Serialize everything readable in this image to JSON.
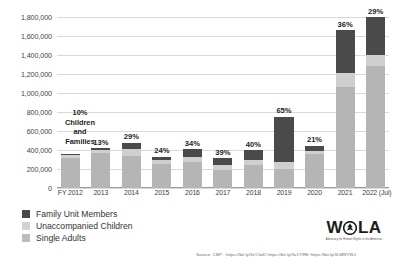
{
  "chart_data": {
    "type": "bar",
    "stacked": true,
    "title": "",
    "xlabel": "",
    "ylabel": "",
    "ylim": [
      0,
      1800000
    ],
    "ytick_step": 200000,
    "grid": true,
    "legend_position": "bottom-left",
    "categories": [
      "FY 2012",
      "2013",
      "2014",
      "2015",
      "2016",
      "2017",
      "2018",
      "2019",
      "2020",
      "2021",
      "2022 (Jul)"
    ],
    "ytick_labels": [
      "0",
      "200,000",
      "400,000",
      "600,000",
      "800,000",
      "1,000,000",
      "1,200,000",
      "1,400,000",
      "1,600,000",
      "1,800,000"
    ],
    "series": [
      {
        "name": "Single Adults",
        "key": "single",
        "color": "#b5b5b5",
        "values": [
          320000,
          365000,
          340000,
          250000,
          270000,
          190000,
          240000,
          195000,
          360000,
          1060000,
          1320000
        ]
      },
      {
        "name": "Unaccompanied Children",
        "key": "unacc",
        "color": "#cfcfcf",
        "values": [
          24000,
          39000,
          69000,
          40000,
          60000,
          49000,
          50000,
          80000,
          33000,
          147000,
          127000
        ]
      },
      {
        "name": "Family Unit Members",
        "key": "fam",
        "color": "#4a4a4a",
        "values": [
          11000,
          15000,
          68000,
          40000,
          78000,
          76000,
          107000,
          474000,
          53000,
          452000,
          409000
        ]
      }
    ],
    "bar_labels": [
      "10%",
      "13%",
      "29%",
      "24%",
      "34%",
      "39%",
      "40%",
      "65%",
      "21%",
      "36%",
      "29%"
    ],
    "annotation": {
      "lines": [
        "10%",
        "Children",
        "and",
        "Families"
      ]
    }
  },
  "legend": {
    "items": [
      {
        "label": "Family Unit Members",
        "swatch": "sw-fam"
      },
      {
        "label": "Unaccompanied Children",
        "swatch": "sw-unacc"
      },
      {
        "label": "Single Adults",
        "swatch": "sw-single"
      }
    ]
  },
  "source": {
    "text": "Source: CBP - https://bit.ly/3xTJwD https://bit.ly/3v1Y9Rr https://bit.ly/3LMNYWJ"
  },
  "logo": {
    "text_left": "W",
    "text_right": "LA",
    "tagline": "Advocacy for Human Rights in the Americas"
  },
  "colors": {
    "family_unit": "#4a4a4a",
    "unaccompanied": "#cfcfcf",
    "single_adults": "#b5b5b5",
    "gridline": "#d9d9d9"
  }
}
